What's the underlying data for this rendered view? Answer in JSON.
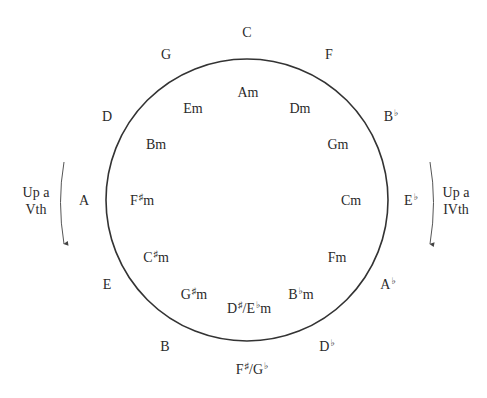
{
  "diagram": {
    "circle": {
      "cx": 247,
      "cy": 200,
      "r": 141,
      "stroke": "#333333"
    },
    "major_keys": [
      {
        "id": "c",
        "root": "C",
        "acc": "",
        "x": 247,
        "y": 33
      },
      {
        "id": "f",
        "root": "F",
        "acc": "",
        "x": 329,
        "y": 55
      },
      {
        "id": "b-flat",
        "root": "B",
        "acc": "♭",
        "x": 391,
        "y": 117
      },
      {
        "id": "e-flat",
        "root": "E",
        "acc": "♭",
        "x": 411,
        "y": 201
      },
      {
        "id": "a-flat",
        "root": "A",
        "acc": "♭",
        "x": 388,
        "y": 285
      },
      {
        "id": "d-flat",
        "root": "D",
        "acc": "♭",
        "x": 327,
        "y": 347
      },
      {
        "id": "f-sharp-g-flat",
        "root": "F",
        "acc": "♯",
        "slash": "/G",
        "acc2": "♭",
        "x": 252,
        "y": 370
      },
      {
        "id": "b",
        "root": "B",
        "acc": "",
        "x": 165,
        "y": 347
      },
      {
        "id": "e",
        "root": "E",
        "acc": "",
        "x": 107,
        "y": 285
      },
      {
        "id": "a",
        "root": "A",
        "acc": "",
        "x": 84,
        "y": 201
      },
      {
        "id": "d",
        "root": "D",
        "acc": "",
        "x": 107,
        "y": 117
      },
      {
        "id": "g",
        "root": "G",
        "acc": "",
        "x": 166,
        "y": 55
      }
    ],
    "minor_keys": [
      {
        "id": "am",
        "root": "A",
        "acc": "",
        "suffix": "m",
        "x": 248,
        "y": 93
      },
      {
        "id": "dm",
        "root": "D",
        "acc": "",
        "suffix": "m",
        "x": 300,
        "y": 109
      },
      {
        "id": "gm",
        "root": "G",
        "acc": "",
        "suffix": "m",
        "x": 338,
        "y": 145
      },
      {
        "id": "cm",
        "root": "C",
        "acc": "",
        "suffix": "m",
        "x": 351,
        "y": 201
      },
      {
        "id": "fm",
        "root": "F",
        "acc": "",
        "suffix": "m",
        "x": 337,
        "y": 258
      },
      {
        "id": "b-flat-m",
        "root": "B",
        "acc": "♭",
        "suffix": "m",
        "x": 301,
        "y": 295
      },
      {
        "id": "d-sharp-e-flat-m",
        "root": "D",
        "acc": "♯",
        "slash": "/E",
        "acc2": "♭",
        "suffix": "m",
        "x": 249,
        "y": 309
      },
      {
        "id": "g-sharp-m",
        "root": "G",
        "acc": "♯",
        "suffix": "m",
        "x": 194,
        "y": 295
      },
      {
        "id": "c-sharp-m",
        "root": "C",
        "acc": "♯",
        "suffix": "m",
        "x": 156,
        "y": 258
      },
      {
        "id": "f-sharp-m",
        "root": "F",
        "acc": "♯",
        "suffix": "m",
        "x": 142,
        "y": 201
      },
      {
        "id": "bm",
        "root": "B",
        "acc": "",
        "suffix": "m",
        "x": 156,
        "y": 145
      },
      {
        "id": "em",
        "root": "E",
        "acc": "",
        "suffix": "m",
        "x": 193,
        "y": 109
      }
    ],
    "annotations": {
      "left": {
        "line1": "Up a",
        "line2": "Vth"
      },
      "right": {
        "line1": "Up a",
        "line2": "IVth"
      }
    }
  }
}
